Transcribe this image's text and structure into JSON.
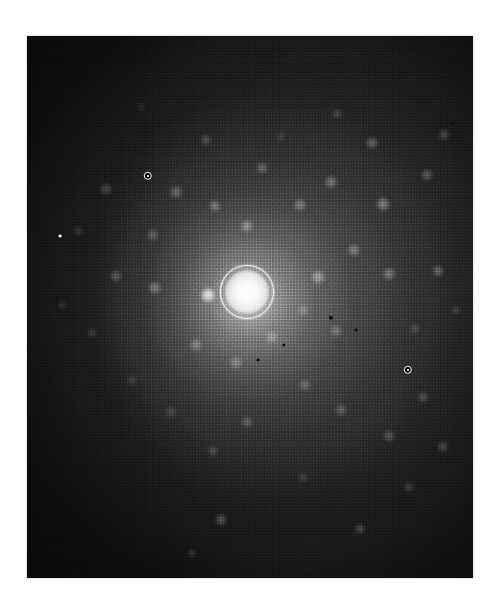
{
  "image": {
    "kind": "diffraction-pattern-photograph",
    "description": "Grayscale electron diffraction pattern on photographic plate",
    "background_color": "#ffffff",
    "plate": {
      "x": 27,
      "y": 36,
      "width": 446,
      "height": 542,
      "base_color": "#0a0a0a",
      "border_color": "#d2d2d2"
    }
  },
  "chart_data": {
    "type": "scatter",
    "title": "",
    "subtitle": "",
    "xlabel": "",
    "ylabel": "",
    "grid": false,
    "legend": null,
    "annotations": [
      {
        "name": "marker-upper-left",
        "x": 148,
        "y": 176,
        "radius": 4.2,
        "style": "white-ring-dark-center"
      },
      {
        "name": "marker-lower-right",
        "x": 408,
        "y": 370,
        "radius": 4.2,
        "style": "white-ring-dark-center"
      }
    ],
    "center_beam": {
      "name": "transmitted-beam",
      "x": 247,
      "y": 292,
      "core_radius": 22,
      "ring_radius": 26,
      "intensity": 1.0
    },
    "points": [
      {
        "x": 208,
        "y": 295,
        "r": 7.5,
        "i": 0.92
      },
      {
        "x": 247,
        "y": 226,
        "r": 6.5,
        "i": 0.4
      },
      {
        "x": 215,
        "y": 206,
        "r": 6.0,
        "i": 0.34
      },
      {
        "x": 176,
        "y": 192,
        "r": 6.5,
        "i": 0.3
      },
      {
        "x": 262,
        "y": 168,
        "r": 6.0,
        "i": 0.3
      },
      {
        "x": 206,
        "y": 140,
        "r": 5.5,
        "i": 0.22
      },
      {
        "x": 300,
        "y": 205,
        "r": 6.5,
        "i": 0.34
      },
      {
        "x": 331,
        "y": 182,
        "r": 6.5,
        "i": 0.34
      },
      {
        "x": 383,
        "y": 204,
        "r": 7.0,
        "i": 0.4
      },
      {
        "x": 372,
        "y": 143,
        "r": 6.0,
        "i": 0.3
      },
      {
        "x": 427,
        "y": 175,
        "r": 6.0,
        "i": 0.28
      },
      {
        "x": 444,
        "y": 135,
        "r": 5.5,
        "i": 0.22
      },
      {
        "x": 337,
        "y": 114,
        "r": 5.0,
        "i": 0.18
      },
      {
        "x": 318,
        "y": 277,
        "r": 7.0,
        "i": 0.44
      },
      {
        "x": 354,
        "y": 250,
        "r": 6.5,
        "i": 0.36
      },
      {
        "x": 389,
        "y": 274,
        "r": 6.5,
        "i": 0.36
      },
      {
        "x": 438,
        "y": 271,
        "r": 6.0,
        "i": 0.3
      },
      {
        "x": 155,
        "y": 288,
        "r": 6.5,
        "i": 0.34
      },
      {
        "x": 116,
        "y": 276,
        "r": 6.0,
        "i": 0.26
      },
      {
        "x": 153,
        "y": 235,
        "r": 6.0,
        "i": 0.26
      },
      {
        "x": 106,
        "y": 189,
        "r": 6.0,
        "i": 0.22
      },
      {
        "x": 196,
        "y": 345,
        "r": 6.5,
        "i": 0.32
      },
      {
        "x": 236,
        "y": 363,
        "r": 6.5,
        "i": 0.32
      },
      {
        "x": 272,
        "y": 337,
        "r": 6.5,
        "i": 0.34
      },
      {
        "x": 303,
        "y": 310,
        "r": 5.5,
        "i": 0.28
      },
      {
        "x": 336,
        "y": 331,
        "r": 6.0,
        "i": 0.3
      },
      {
        "x": 305,
        "y": 385,
        "r": 6.0,
        "i": 0.28
      },
      {
        "x": 341,
        "y": 410,
        "r": 6.0,
        "i": 0.26
      },
      {
        "x": 389,
        "y": 436,
        "r": 6.0,
        "i": 0.24
      },
      {
        "x": 423,
        "y": 397,
        "r": 5.5,
        "i": 0.22
      },
      {
        "x": 443,
        "y": 447,
        "r": 5.5,
        "i": 0.22
      },
      {
        "x": 247,
        "y": 422,
        "r": 6.0,
        "i": 0.24
      },
      {
        "x": 213,
        "y": 451,
        "r": 5.5,
        "i": 0.2
      },
      {
        "x": 171,
        "y": 412,
        "r": 5.5,
        "i": 0.18
      },
      {
        "x": 132,
        "y": 380,
        "r": 5.0,
        "i": 0.16
      },
      {
        "x": 221,
        "y": 520,
        "r": 6.0,
        "i": 0.26
      },
      {
        "x": 360,
        "y": 529,
        "r": 5.5,
        "i": 0.22
      },
      {
        "x": 409,
        "y": 487,
        "r": 5.0,
        "i": 0.18
      },
      {
        "x": 303,
        "y": 477,
        "r": 5.0,
        "i": 0.16
      },
      {
        "x": 92,
        "y": 333,
        "r": 5.0,
        "i": 0.14
      },
      {
        "x": 78,
        "y": 231,
        "r": 5.0,
        "i": 0.14
      },
      {
        "x": 62,
        "y": 305,
        "r": 4.5,
        "i": 0.12
      },
      {
        "x": 415,
        "y": 329,
        "r": 5.0,
        "i": 0.18
      },
      {
        "x": 456,
        "y": 310,
        "r": 4.5,
        "i": 0.14
      },
      {
        "x": 192,
        "y": 553,
        "r": 4.5,
        "i": 0.14
      },
      {
        "x": 281,
        "y": 137,
        "r": 4.5,
        "i": 0.14
      },
      {
        "x": 141,
        "y": 107,
        "r": 4.5,
        "i": 0.1
      }
    ],
    "specks": [
      {
        "x": 331,
        "y": 318,
        "r": 2.2,
        "shade": "#0a0a0a"
      },
      {
        "x": 284,
        "y": 345,
        "r": 1.6,
        "shade": "#0d0d0d"
      },
      {
        "x": 356,
        "y": 330,
        "r": 1.4,
        "shade": "#101010"
      },
      {
        "x": 258,
        "y": 360,
        "r": 1.4,
        "shade": "#101010"
      },
      {
        "x": 60,
        "y": 236,
        "r": 1.4,
        "shade": "#f0f0f0"
      },
      {
        "x": 452,
        "y": 123,
        "r": 1.3,
        "shade": "#101010"
      }
    ]
  }
}
